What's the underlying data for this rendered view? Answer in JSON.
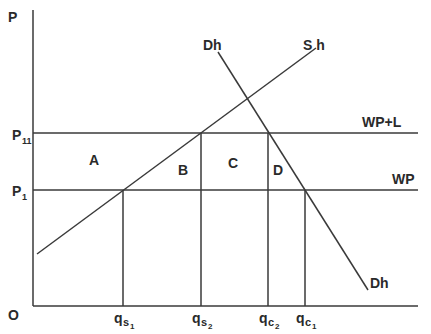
{
  "diagram": {
    "axes": {
      "y_label": "P",
      "origin_label": "O"
    },
    "price_levels": [
      {
        "name": "P11",
        "base": "P",
        "sub": "11",
        "line_label": "WP+L"
      },
      {
        "name": "P1",
        "base": "P",
        "sub": "1",
        "line_label": "WP"
      }
    ],
    "curves": {
      "supply": "S h",
      "demand_top": "Dh",
      "demand_bottom": "Dh"
    },
    "areas": [
      "A",
      "B",
      "C",
      "D"
    ],
    "quantities": [
      {
        "base": "q",
        "sub": "s",
        "subsub": "1"
      },
      {
        "base": "q",
        "sub": "s",
        "subsub": "2"
      },
      {
        "base": "q",
        "sub": "c",
        "subsub": "2"
      },
      {
        "base": "q",
        "sub": "c",
        "subsub": "1"
      }
    ]
  }
}
